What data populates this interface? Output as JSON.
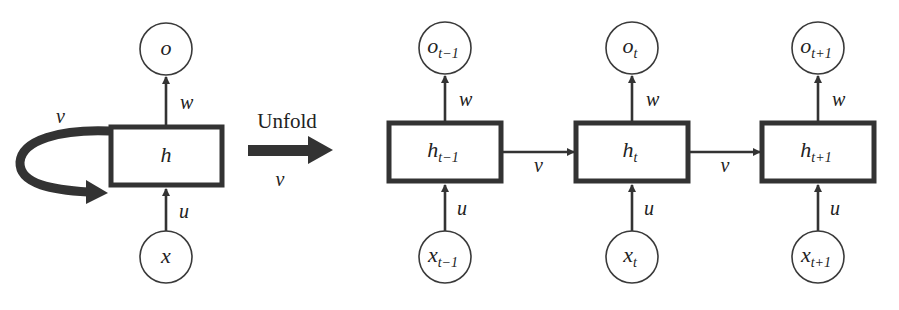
{
  "diagram": {
    "folded": {
      "input": {
        "base": "x",
        "sub": ""
      },
      "hidden": {
        "base": "h",
        "sub": ""
      },
      "output": {
        "base": "o",
        "sub": ""
      },
      "input_weight": "u",
      "output_weight": "w",
      "recurrent_weight": "v"
    },
    "unfold": {
      "label": "Unfold",
      "weight": "v"
    },
    "steps": [
      {
        "input": {
          "base": "x",
          "sub": "t−1"
        },
        "hidden": {
          "base": "h",
          "sub": "t−1"
        },
        "output": {
          "base": "o",
          "sub": "t−1"
        },
        "input_weight": "u",
        "output_weight": "w",
        "next_weight": "v"
      },
      {
        "input": {
          "base": "x",
          "sub": "t"
        },
        "hidden": {
          "base": "h",
          "sub": "t"
        },
        "output": {
          "base": "o",
          "sub": "t"
        },
        "input_weight": "u",
        "output_weight": "w",
        "next_weight": "v"
      },
      {
        "input": {
          "base": "x",
          "sub": "t+1"
        },
        "hidden": {
          "base": "h",
          "sub": "t+1"
        },
        "output": {
          "base": "o",
          "sub": "t+1"
        },
        "input_weight": "u",
        "output_weight": "w",
        "next_weight": ""
      }
    ],
    "colors": {
      "stroke": "#333333",
      "background": "#ffffff"
    }
  }
}
